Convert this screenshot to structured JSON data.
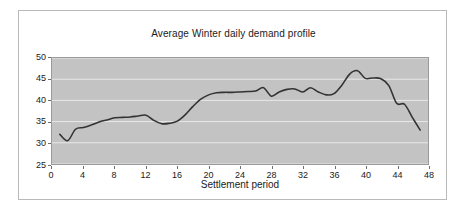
{
  "figure": {
    "background_color": "#ffffff",
    "border_color": "#b9b9b9",
    "plot_background_color": "#c3c3c3",
    "gridline_color": "#e9e9e9",
    "axis_color": "#6f6f6f",
    "line_color": "#333333"
  },
  "chart_data": {
    "type": "line",
    "title": "Average Winter daily demand profile",
    "xlabel": "Settlement period",
    "ylabel": "",
    "xlim": [
      0,
      48
    ],
    "ylim": [
      25,
      50
    ],
    "xticks": [
      0,
      4,
      8,
      12,
      16,
      20,
      24,
      28,
      32,
      36,
      40,
      44,
      48
    ],
    "yticks": [
      25,
      30,
      35,
      40,
      45,
      50
    ],
    "grid": true,
    "grid_axis": "y",
    "legend": false,
    "series": [
      {
        "name": "Average winter demand",
        "x": [
          1,
          2,
          3,
          4,
          5,
          6,
          7,
          8,
          9,
          10,
          11,
          12,
          13,
          14,
          15,
          16,
          17,
          18,
          19,
          20,
          21,
          22,
          23,
          24,
          25,
          26,
          27,
          28,
          29,
          30,
          31,
          32,
          33,
          34,
          35,
          36,
          37,
          38,
          39,
          40,
          41,
          42,
          43,
          44,
          45,
          46,
          47
        ],
        "values": [
          32.0,
          30.5,
          33.2,
          33.6,
          34.2,
          34.9,
          35.4,
          35.9,
          36.0,
          36.1,
          36.3,
          36.5,
          35.3,
          34.5,
          34.6,
          35.1,
          36.6,
          38.6,
          40.3,
          41.3,
          41.8,
          41.9,
          41.9,
          42.0,
          42.1,
          42.2,
          43.0,
          41.0,
          42.0,
          42.6,
          42.7,
          42.0,
          43.0,
          42.0,
          41.3,
          41.6,
          43.6,
          46.2,
          47.0,
          45.2,
          45.3,
          45.1,
          43.5,
          39.3,
          39.1,
          36.0,
          33.0
        ]
      }
    ]
  }
}
